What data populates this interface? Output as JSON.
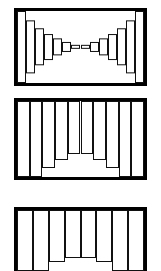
{
  "figure": {
    "background_color": "#ffffff",
    "line_color": "#111111",
    "frame_color": "#000000",
    "fill_color": "#ffffff"
  },
  "chart_data": [
    {
      "type": "bar",
      "title": "",
      "xlabel": "",
      "ylabel": "",
      "orientation": "centered",
      "grid": false,
      "legend": null,
      "panel_index": 1,
      "panel_name": "bowtie-symmetric-taper",
      "description": "Symmetric hourglass / bowtie of vertically centered bars: tall at both outer edges, tapering to near zero at the center.",
      "ylim": [
        0,
        100
      ],
      "categories": [
        "1",
        "2",
        "3",
        "4",
        "5",
        "6",
        "7",
        "8",
        "9",
        "10",
        "11",
        "12",
        "13",
        "14"
      ],
      "values": [
        100,
        74,
        52,
        36,
        24,
        14,
        6,
        6,
        14,
        24,
        36,
        52,
        74,
        100
      ]
    },
    {
      "type": "bar",
      "title": "",
      "xlabel": "",
      "ylabel": "",
      "orientation": "hanging",
      "grid": false,
      "legend": null,
      "panel_index": 2,
      "panel_name": "u-shaped-valley",
      "description": "U-shaped valley: bars drop from the top edge, full height at the outer edges and stepping down to a flat minimum at the center.",
      "ylim": [
        0,
        100
      ],
      "categories": [
        "1",
        "2",
        "3",
        "4",
        "5",
        "6",
        "7",
        "8",
        "9",
        "10"
      ],
      "values": [
        100,
        100,
        88,
        78,
        70,
        70,
        78,
        88,
        100,
        100
      ]
    },
    {
      "type": "bar",
      "title": "",
      "xlabel": "",
      "ylabel": "",
      "orientation": "hanging",
      "grid": false,
      "legend": null,
      "panel_index": 3,
      "panel_name": "shallow-central-dip",
      "description": "Shallow symmetric central dip, bars hanging from the top edge; panel is clipped by the bottom of the image.",
      "clipped_at_bottom": true,
      "ylim": [
        0,
        100
      ],
      "categories": [
        "1",
        "2",
        "3",
        "4",
        "5",
        "6",
        "7",
        "8"
      ],
      "values": [
        100,
        100,
        86,
        78,
        78,
        86,
        100,
        100
      ]
    }
  ]
}
